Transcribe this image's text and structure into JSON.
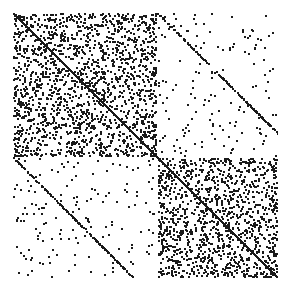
{
  "figure": {
    "background_color": "#ffffff",
    "width": 289,
    "height": 293,
    "title": "",
    "has_axis_frame": false,
    "has_tick_labels": false
  },
  "plot_area": {
    "x": 13,
    "y": 13,
    "width": 265,
    "height": 265
  },
  "chart_data": {
    "type": "heatmap",
    "subtype": "spy-sparsity-pattern",
    "title": "",
    "subtitle": "",
    "xlabel": "",
    "ylabel": "",
    "legend": [],
    "annotations": [],
    "grid": false,
    "axis_frame": false,
    "tick_labels": false,
    "marker_color": "#1a1a1a",
    "background_color": "#ffffff",
    "n_rows": 265,
    "n_cols": 265,
    "xlim": [
      0,
      265
    ],
    "ylim": [
      0,
      265
    ],
    "origin": "upper",
    "marker_size_px": 2,
    "random_seed": 20240517,
    "block_split_fraction": 0.545,
    "blocks": [
      {
        "name": "block-1-1",
        "row_range": [
          0.0,
          0.545
        ],
        "col_range": [
          0.0,
          0.545
        ],
        "density": 0.33,
        "label": "dense diagonal block 1"
      },
      {
        "name": "block-1-2",
        "row_range": [
          0.0,
          0.545
        ],
        "col_range": [
          0.545,
          1.0
        ],
        "density": 0.035,
        "label": "sparse coupling block"
      },
      {
        "name": "block-2-1",
        "row_range": [
          0.545,
          1.0
        ],
        "col_range": [
          0.0,
          0.545
        ],
        "density": 0.035,
        "label": "sparse coupling block"
      },
      {
        "name": "block-2-2",
        "row_range": [
          0.545,
          1.0
        ],
        "col_range": [
          0.545,
          1.0
        ],
        "density": 0.33,
        "label": "dense diagonal block 2"
      }
    ],
    "diagonals": [
      {
        "name": "main-diagonal",
        "offset": 0,
        "density": 1.0,
        "color": "#1a1a1a",
        "label": "principal diagonal"
      }
    ],
    "edge_emphasis": {
      "enabled": true,
      "bands_px": 6,
      "extra_density": 0.18,
      "label": "increased density along block borders"
    }
  }
}
